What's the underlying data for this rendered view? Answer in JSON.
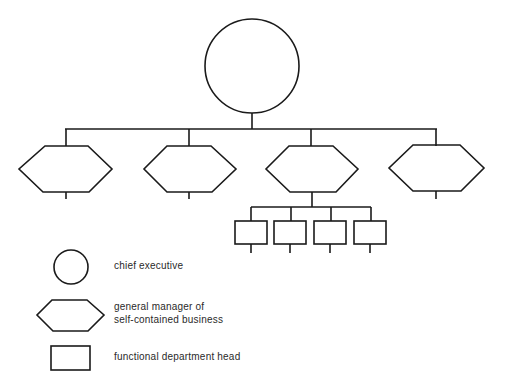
{
  "diagram": {
    "type": "organization-chart",
    "nodes": {
      "chief_executive": {
        "shape": "circle",
        "count": 1
      },
      "general_managers": {
        "shape": "hexagon",
        "count": 4
      },
      "functional_heads": {
        "shape": "rectangle",
        "count": 4,
        "parent": "general_manager_3"
      }
    }
  },
  "legend": {
    "items": [
      {
        "shape": "circle",
        "label": "chief executive"
      },
      {
        "shape": "hexagon",
        "label_line1": "general manager of",
        "label_line2": "self-contained business"
      },
      {
        "shape": "rectangle",
        "label": "functional department head"
      }
    ]
  },
  "colors": {
    "line": "#1a1a1a",
    "text": "#2a2a2a",
    "background": "#ffffff"
  }
}
